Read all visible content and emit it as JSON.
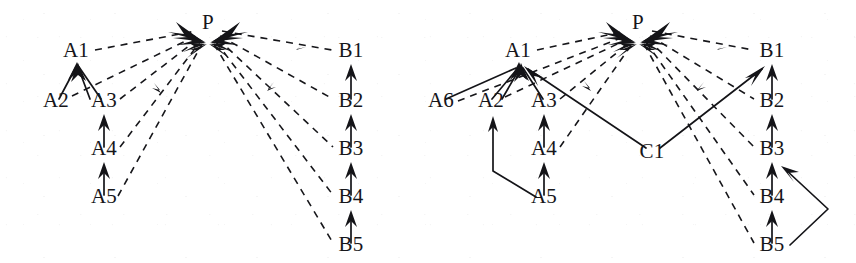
{
  "figure": {
    "background_color": "#ffffff",
    "ink_color": "#16161a",
    "width": 856,
    "height": 263
  },
  "panels": [
    {
      "id": "left-panel",
      "name": "left-graph",
      "nodes": [
        {
          "id": "P",
          "label": "P",
          "x": 208,
          "y": 29
        },
        {
          "id": "A1",
          "label": "A1",
          "x": 76,
          "y": 57
        },
        {
          "id": "A2",
          "label": "A2",
          "x": 56,
          "y": 107
        },
        {
          "id": "A3",
          "label": "A3",
          "x": 104,
          "y": 107
        },
        {
          "id": "A4",
          "label": "A4",
          "x": 104,
          "y": 155
        },
        {
          "id": "A5",
          "label": "A5",
          "x": 104,
          "y": 203
        },
        {
          "id": "B1",
          "label": "B1",
          "x": 351,
          "y": 57
        },
        {
          "id": "B2",
          "label": "B2",
          "x": 351,
          "y": 107
        },
        {
          "id": "B3",
          "label": "B3",
          "x": 351,
          "y": 155
        },
        {
          "id": "B4",
          "label": "B4",
          "x": 351,
          "y": 203
        },
        {
          "id": "B5",
          "label": "B5",
          "x": 351,
          "y": 251
        }
      ],
      "edges": [
        {
          "from": "A1",
          "to": "P",
          "style": "dashed"
        },
        {
          "from": "A2",
          "to": "P",
          "style": "dashed"
        },
        {
          "from": "A3",
          "to": "P",
          "style": "dashed"
        },
        {
          "from": "A4",
          "to": "P",
          "style": "dashed"
        },
        {
          "from": "A5",
          "to": "P",
          "style": "dashed"
        },
        {
          "from": "P",
          "to": "B1",
          "style": "dashed"
        },
        {
          "from": "P",
          "to": "B2",
          "style": "dashed"
        },
        {
          "from": "P",
          "to": "B3",
          "style": "dashed"
        },
        {
          "from": "P",
          "to": "B4",
          "style": "dashed"
        },
        {
          "from": "P",
          "to": "B5",
          "style": "dashed"
        },
        {
          "from": "A2",
          "to": "A1",
          "style": "solid"
        },
        {
          "from": "A3",
          "to": "A1",
          "style": "solid"
        },
        {
          "from": "A4",
          "to": "A3",
          "style": "solid"
        },
        {
          "from": "A5",
          "to": "A4",
          "style": "solid"
        },
        {
          "from": "B2",
          "to": "B1",
          "style": "solid"
        },
        {
          "from": "B3",
          "to": "B2",
          "style": "solid"
        },
        {
          "from": "B4",
          "to": "B3",
          "style": "solid"
        },
        {
          "from": "B5",
          "to": "B4",
          "style": "solid"
        }
      ]
    },
    {
      "id": "right-panel",
      "name": "right-graph",
      "nodes": [
        {
          "id": "P",
          "label": "P",
          "x": 638,
          "y": 29
        },
        {
          "id": "A1",
          "label": "A1",
          "x": 518,
          "y": 57
        },
        {
          "id": "A6",
          "label": "A6",
          "x": 441,
          "y": 107
        },
        {
          "id": "A2",
          "label": "A2",
          "x": 491,
          "y": 107
        },
        {
          "id": "A3",
          "label": "A3",
          "x": 544,
          "y": 107
        },
        {
          "id": "A4",
          "label": "A4",
          "x": 544,
          "y": 155
        },
        {
          "id": "A5",
          "label": "A5",
          "x": 544,
          "y": 203
        },
        {
          "id": "C1",
          "label": "C1",
          "x": 652,
          "y": 158
        },
        {
          "id": "B1",
          "label": "B1",
          "x": 772,
          "y": 57
        },
        {
          "id": "B2",
          "label": "B2",
          "x": 772,
          "y": 107
        },
        {
          "id": "B3",
          "label": "B3",
          "x": 772,
          "y": 155
        },
        {
          "id": "B4",
          "label": "B4",
          "x": 772,
          "y": 203
        },
        {
          "id": "B5",
          "label": "B5",
          "x": 772,
          "y": 251
        }
      ],
      "edges": [
        {
          "from": "A1",
          "to": "P",
          "style": "dashed"
        },
        {
          "from": "A2",
          "to": "P",
          "style": "dashed"
        },
        {
          "from": "A3",
          "to": "P",
          "style": "dashed"
        },
        {
          "from": "A4",
          "to": "P",
          "style": "dashed"
        },
        {
          "from": "A6",
          "to": "P",
          "style": "dashed"
        },
        {
          "from": "P",
          "to": "B1",
          "style": "dashed"
        },
        {
          "from": "P",
          "to": "B2",
          "style": "dashed"
        },
        {
          "from": "P",
          "to": "B3",
          "style": "dashed"
        },
        {
          "from": "P",
          "to": "B4",
          "style": "dashed"
        },
        {
          "from": "P",
          "to": "B5",
          "style": "dashed"
        },
        {
          "from": "A6",
          "to": "A1",
          "style": "solid"
        },
        {
          "from": "A2",
          "to": "A1",
          "style": "solid"
        },
        {
          "from": "A3",
          "to": "A1",
          "style": "solid"
        },
        {
          "from": "A4",
          "to": "A3",
          "style": "solid"
        },
        {
          "from": "A5",
          "to": "A4",
          "style": "solid"
        },
        {
          "from": "A5",
          "to": "A2",
          "style": "solid-bent"
        },
        {
          "from": "C1",
          "to": "A1",
          "style": "solid"
        },
        {
          "from": "C1",
          "to": "B1",
          "style": "solid"
        },
        {
          "from": "B2",
          "to": "B1",
          "style": "solid"
        },
        {
          "from": "B3",
          "to": "B2",
          "style": "solid"
        },
        {
          "from": "B4",
          "to": "B3",
          "style": "solid"
        },
        {
          "from": "B5",
          "to": "B4",
          "style": "solid"
        },
        {
          "from": "B5",
          "to": "B3",
          "style": "solid-bent"
        }
      ]
    }
  ]
}
